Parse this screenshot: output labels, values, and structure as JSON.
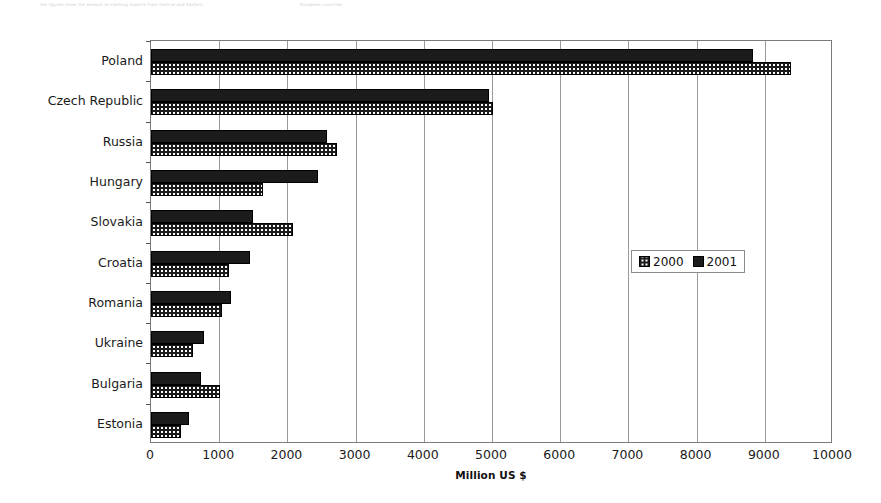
{
  "chart_data": {
    "type": "bar",
    "orientation": "horizontal",
    "title": "",
    "xlabel": "Million US $",
    "ylabel": "",
    "xlim": [
      0,
      10000
    ],
    "xticks": [
      0,
      1000,
      2000,
      3000,
      4000,
      5000,
      6000,
      7000,
      8000,
      9000,
      10000
    ],
    "xtick_labels": [
      "0",
      "1000",
      "2000",
      "3000",
      "4000",
      "5000",
      "6000",
      "7000",
      "8000",
      "9000",
      "10000"
    ],
    "grid": true,
    "grid_axis": "x",
    "legend_position": "center-right",
    "categories": [
      "Poland",
      "Czech Republic",
      "Russia",
      "Hungary",
      "Slovakia",
      "Croatia",
      "Romania",
      "Ukraine",
      "Bulgaria",
      "Estonia"
    ],
    "series": [
      {
        "name": "2000",
        "pattern": "dotted",
        "color": "#1b1b1b",
        "values": [
          9380,
          5020,
          2730,
          1640,
          2080,
          1140,
          1040,
          615,
          1010,
          440
        ]
      },
      {
        "name": "2001",
        "pattern": "solid",
        "color": "#1b1b1b",
        "values": [
          8830,
          4950,
          2580,
          2450,
          1490,
          1450,
          1170,
          775,
          730,
          560
        ]
      }
    ]
  },
  "legend": {
    "entries": [
      {
        "label": "2000",
        "swatch": "dotted-swatch-icon"
      },
      {
        "label": "2001",
        "swatch": "solid-swatch-icon"
      }
    ]
  },
  "scan_artifacts": [
    "the figures show the amount of clothing imports from Central and Eastern",
    "European countries"
  ]
}
